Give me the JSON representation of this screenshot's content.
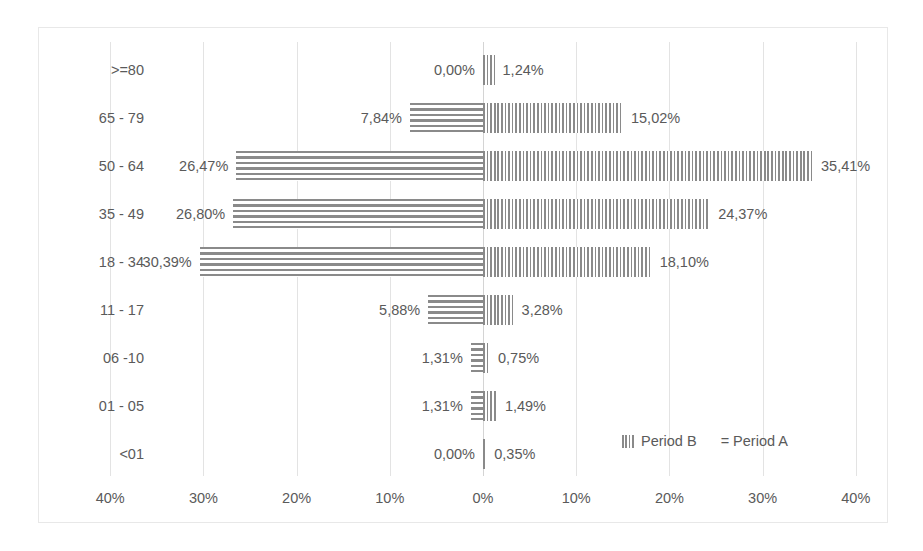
{
  "chart_data": {
    "type": "bar",
    "subtype": "population-pyramid",
    "title": "",
    "xlabel": "",
    "ylabel": "",
    "categories": [
      ">=80",
      "65 - 79",
      "50 - 64",
      "35 - 49",
      "18 - 34",
      "11 - 17",
      "06 -10",
      "01 - 05",
      "<01"
    ],
    "series": [
      {
        "name": "Period A",
        "side": "left",
        "pattern": "horizontal-stripes",
        "values": [
          0.0,
          7.84,
          26.47,
          26.8,
          30.39,
          5.88,
          1.31,
          1.31,
          0.0
        ],
        "labels": [
          "0,00%",
          "7,84%",
          "26,47%",
          "26,80%",
          "30,39%",
          "5,88%",
          "1,31%",
          "1,31%",
          "0,00%"
        ]
      },
      {
        "name": "Period B",
        "side": "right",
        "pattern": "vertical-stripes",
        "values": [
          1.24,
          15.02,
          35.41,
          24.37,
          18.1,
          3.28,
          0.75,
          1.49,
          0.35
        ],
        "labels": [
          "1,24%",
          "15,02%",
          "35,41%",
          "24,37%",
          "18,10%",
          "3,28%",
          "0,75%",
          "1,49%",
          "0,35%"
        ]
      }
    ],
    "xticks": [
      {
        "label": "40%",
        "value": -40
      },
      {
        "label": "30%",
        "value": -30
      },
      {
        "label": "20%",
        "value": -20
      },
      {
        "label": "10%",
        "value": -10
      },
      {
        "label": "0%",
        "value": 0
      },
      {
        "label": "10%",
        "value": 10
      },
      {
        "label": "20%",
        "value": 20
      },
      {
        "label": "30%",
        "value": 30
      },
      {
        "label": "40%",
        "value": 40
      }
    ],
    "xlim": [
      -45,
      45
    ],
    "grid": true,
    "legend": {
      "position": "inside-bottom-right",
      "entries": [
        {
          "label": "Period B",
          "pattern": "vertical-stripes"
        },
        {
          "label": "= Period A",
          "pattern": "horizontal-stripes"
        }
      ]
    },
    "colors": {
      "bar": "#8a8a8a",
      "text": "#5a5a5a",
      "grid": "#e3e3e3",
      "border": "#e8e8e8",
      "background": "#ffffff"
    }
  }
}
